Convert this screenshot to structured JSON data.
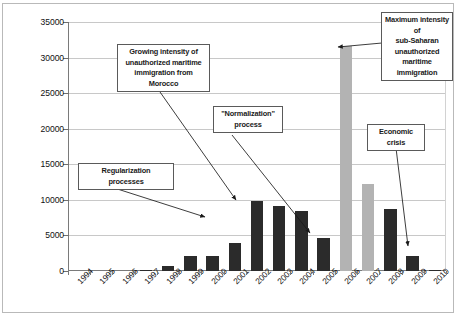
{
  "chart_data": {
    "type": "bar",
    "title": "",
    "subtitle": "",
    "xlabel": "",
    "ylabel": "",
    "ylim": [
      0,
      35000
    ],
    "ytick_labels": [
      "0",
      "5000",
      "10000",
      "15000",
      "20000",
      "25000",
      "30000",
      "35000"
    ],
    "ytick_values": [
      0,
      5000,
      10000,
      15000,
      20000,
      25000,
      30000,
      35000
    ],
    "grid": true,
    "legend": "none",
    "categories": [
      "1994",
      "1995",
      "1996",
      "1997",
      "1998",
      "1999",
      "2000",
      "2001",
      "2002",
      "2003",
      "2004",
      "2005",
      "2006",
      "2007",
      "2008",
      "2009",
      "2010"
    ],
    "values": [
      0,
      0,
      0,
      200,
      700,
      2100,
      2100,
      4000,
      9800,
      9200,
      8400,
      4700,
      31600,
      12200,
      8700,
      2100,
      200
    ],
    "bar_colors": [
      "#2b2b2b",
      "#2b2b2b",
      "#2b2b2b",
      "#2b2b2b",
      "#2b2b2b",
      "#2b2b2b",
      "#2b2b2b",
      "#2b2b2b",
      "#2b2b2b",
      "#2b2b2b",
      "#2b2b2b",
      "#2b2b2b",
      "#b3b3b3",
      "#b3b3b3",
      "#2b2b2b",
      "#2b2b2b",
      "#2b2b2b"
    ],
    "annotations": [
      {
        "id": "regularization",
        "text": "Regularization\nprocesses",
        "lines": [
          "Regularization",
          "processes"
        ],
        "points_to_year": "2001"
      },
      {
        "id": "morocco",
        "text": "Growing intensity of unauthorized maritime immigration from Morocco",
        "lines": [
          "Growing intensity of",
          "unauthorized maritime",
          "immigration from",
          "Morocco"
        ],
        "points_to_year": "2002"
      },
      {
        "id": "normalization",
        "text": "\"Normalization\" process",
        "lines": [
          "\"Normalization\"",
          "process"
        ],
        "points_to_year": "2005"
      },
      {
        "id": "max-intensity",
        "text": "Maximum intensity of sub-Saharan unauthorized maritime immigration",
        "lines": [
          "Maximum intensity of",
          "sub-Saharan",
          "unauthorized",
          "maritime immigration"
        ],
        "points_to_year": "2006"
      },
      {
        "id": "economic-crisis",
        "text": "Economic crisis",
        "lines": [
          "Economic",
          "crisis"
        ],
        "points_to_year": "2009"
      }
    ],
    "colors": {
      "bar_dark": "#2b2b2b",
      "bar_gray": "#b3b3b3",
      "gridline": "#c8c8c8",
      "axis": "#7a7a7a",
      "callout_border": "#5a5a5a",
      "background": "#ffffff"
    }
  }
}
